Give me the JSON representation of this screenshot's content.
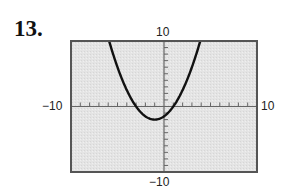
{
  "problem": {
    "number": "13."
  },
  "chart_data": {
    "type": "line",
    "title": "",
    "xlabel": "",
    "ylabel": "",
    "xlim": [
      -10,
      10
    ],
    "ylim": [
      -10,
      10
    ],
    "xscale": 1,
    "yscale": 1,
    "grid": false,
    "tick_labels": {
      "x_min": "−10",
      "x_max": "10",
      "y_min": "−10",
      "y_max": "10"
    },
    "series": [
      {
        "name": "parabola",
        "equation": "y = 0.5(x + 1)^2 - 2",
        "vertex": [
          -1,
          -2
        ],
        "x_intercepts": [
          -3,
          1
        ],
        "y_intercept": -1.5,
        "x": [
          -5.9,
          -5,
          -4,
          -3,
          -2,
          -1,
          0,
          1,
          2,
          3,
          3.9
        ],
        "values": [
          10,
          6,
          2.5,
          0,
          -1.5,
          -2,
          -1.5,
          0,
          2.5,
          6,
          10
        ]
      }
    ],
    "colors": {
      "background": "#e6e6e6",
      "frame": "#555555",
      "curve": "#111111"
    }
  }
}
